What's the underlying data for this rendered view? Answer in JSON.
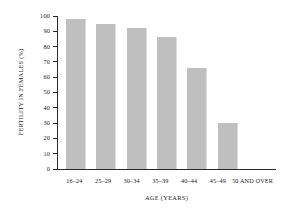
{
  "chart_data": {
    "type": "bar",
    "title": "",
    "xlabel": "AGE (YEARS)",
    "ylabel": "FERTILITY IN FEMALES (%)",
    "categories": [
      "16–24",
      "25–29",
      "30–34",
      "35–39",
      "40–44",
      "45–49",
      "50 AND OVER"
    ],
    "values": [
      98,
      95,
      92,
      86,
      66,
      30,
      0
    ],
    "ylim": [
      0,
      100
    ],
    "yticks": [
      100,
      90,
      80,
      70,
      60,
      50,
      40,
      30,
      20,
      10,
      0
    ],
    "ytick_labels": [
      "100",
      "90",
      "80",
      "70",
      "60",
      "50",
      "40",
      "30",
      "20",
      "10",
      "0"
    ],
    "grid": false,
    "legend": false,
    "bar_color": "#bfbfbf",
    "axis_color": "#2a2a2a",
    "background_color": "#ffffff"
  }
}
